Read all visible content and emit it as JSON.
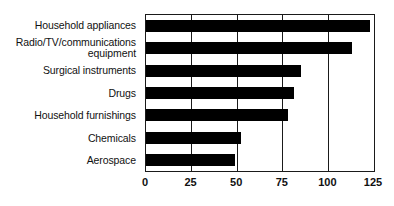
{
  "chart_data": {
    "type": "bar",
    "orientation": "horizontal",
    "title": "",
    "xlabel": "",
    "ylabel": "",
    "xlim": [
      0,
      125
    ],
    "grid": true,
    "legend": false,
    "xticks": [
      "0",
      "25",
      "50",
      "75",
      "100",
      "125"
    ],
    "xtick_values": [
      0,
      25,
      50,
      75,
      100,
      125
    ],
    "categories": [
      "Household appliances",
      "Radio/TV/communications\nequipment",
      "Surgical instruments",
      "Drugs",
      "Household furnishings",
      "Chemicals",
      "Aerospace"
    ],
    "values": [
      123,
      113,
      85,
      81,
      78,
      52,
      49
    ],
    "bar_color": "#000000",
    "axis_color": "#1a1a1a",
    "background_color": "#ffffff"
  }
}
